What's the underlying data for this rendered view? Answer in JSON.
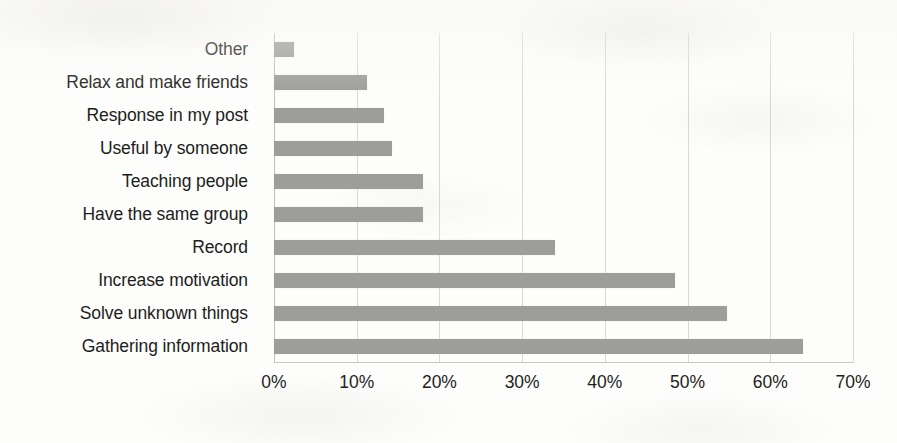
{
  "chart_data": {
    "type": "bar",
    "orientation": "horizontal",
    "title": "",
    "subtitle": "",
    "xlabel": "",
    "ylabel": "",
    "xlim": [
      0,
      70
    ],
    "grid": true,
    "legend": false,
    "legend_position": "none",
    "tick_suffix": "%",
    "bar_color": "#9d9d9b",
    "background_color": "#fdfdfb",
    "gridline_color": "#d9d9d6",
    "text_color": "#1d1d1d",
    "xticks": [
      {
        "value": 0,
        "label": "0%"
      },
      {
        "value": 10,
        "label": "10%"
      },
      {
        "value": 20,
        "label": "20%"
      },
      {
        "value": 30,
        "label": "30%"
      },
      {
        "value": 40,
        "label": "40%"
      },
      {
        "value": 50,
        "label": "50%"
      },
      {
        "value": 60,
        "label": "60%"
      },
      {
        "value": 70,
        "label": "70%"
      }
    ],
    "categories": [
      "Other",
      "Relax and make friends",
      "Response in my post",
      "Useful by someone",
      "Teaching people",
      "Have the same group",
      "Record",
      "Increase motivation",
      "Solve unknown things",
      "Gathering information"
    ],
    "values": [
      2.4,
      11.2,
      13.3,
      14.3,
      18.0,
      18.0,
      34.0,
      48.5,
      54.8,
      64.0
    ],
    "series": [
      {
        "name": "Percentage of respondents",
        "values": [
          2.4,
          11.2,
          13.3,
          14.3,
          18.0,
          18.0,
          34.0,
          48.5,
          54.8,
          64.0
        ]
      }
    ],
    "points": [
      {
        "category": "Other",
        "value": 2.4
      },
      {
        "category": "Relax and make friends",
        "value": 11.2
      },
      {
        "category": "Response in my post",
        "value": 13.3
      },
      {
        "category": "Useful by someone",
        "value": 14.3
      },
      {
        "category": "Teaching people",
        "value": 18.0
      },
      {
        "category": "Have the same group",
        "value": 18.0
      },
      {
        "category": "Record",
        "value": 34.0
      },
      {
        "category": "Increase motivation",
        "value": 48.5
      },
      {
        "category": "Solve unknown things",
        "value": 54.8
      },
      {
        "category": "Gathering information",
        "value": 64.0
      }
    ]
  }
}
